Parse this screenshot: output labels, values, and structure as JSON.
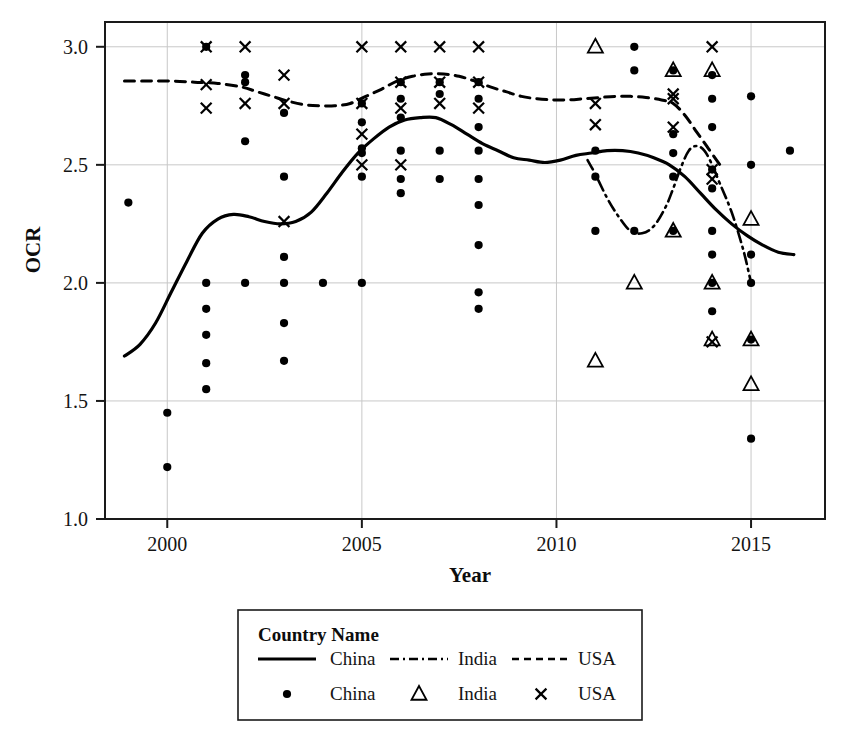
{
  "chart_data": {
    "type": "scatter",
    "title": "",
    "xlabel": "Year",
    "ylabel": "OCR",
    "xlim": [
      1998.4,
      1996.0
    ],
    "x_range": [
      1998.4,
      2016.9
    ],
    "ylim": [
      1.0,
      3.1
    ],
    "grid": true,
    "xticks": [
      2000,
      2005,
      2010,
      2015
    ],
    "xtick_labels": [
      "2000",
      "2005",
      "2010",
      "2015"
    ],
    "yticks": [
      1.0,
      1.5,
      2.0,
      2.5,
      3.0
    ],
    "ytick_labels": [
      "1.0",
      "1.5",
      "2.0",
      "2.5",
      "3.0"
    ],
    "legend": {
      "title": "Country Name",
      "position": "below-plot",
      "line_entries": [
        {
          "label": "China",
          "style": "solid"
        },
        {
          "label": "India",
          "style": "dash-dot"
        },
        {
          "label": "USA",
          "style": "dashed"
        }
      ],
      "marker_entries": [
        {
          "label": "China",
          "marker": "filled-circle"
        },
        {
          "label": "India",
          "marker": "open-triangle"
        },
        {
          "label": "USA",
          "marker": "cross-x"
        }
      ]
    },
    "series": [
      {
        "name": "China",
        "marker": "filled-circle",
        "points": [
          [
            1999,
            2.34
          ],
          [
            2000,
            1.45
          ],
          [
            2000,
            1.22
          ],
          [
            2001,
            3.0
          ],
          [
            2001,
            2.0
          ],
          [
            2001,
            1.89
          ],
          [
            2001,
            1.78
          ],
          [
            2001,
            1.66
          ],
          [
            2001,
            1.55
          ],
          [
            2002,
            2.88
          ],
          [
            2002,
            2.85
          ],
          [
            2002,
            2.6
          ],
          [
            2002,
            2.0
          ],
          [
            2003,
            2.72
          ],
          [
            2003,
            2.45
          ],
          [
            2003,
            2.11
          ],
          [
            2003,
            2.0
          ],
          [
            2003,
            1.83
          ],
          [
            2003,
            1.67
          ],
          [
            2004,
            2.0
          ],
          [
            2005,
            2.76
          ],
          [
            2005,
            2.68
          ],
          [
            2005,
            2.57
          ],
          [
            2005,
            2.55
          ],
          [
            2005,
            2.45
          ],
          [
            2005,
            2.0
          ],
          [
            2006,
            2.85
          ],
          [
            2006,
            2.78
          ],
          [
            2006,
            2.7
          ],
          [
            2006,
            2.56
          ],
          [
            2006,
            2.44
          ],
          [
            2006,
            2.38
          ],
          [
            2007,
            2.85
          ],
          [
            2007,
            2.8
          ],
          [
            2007,
            2.56
          ],
          [
            2007,
            2.44
          ],
          [
            2008,
            2.85
          ],
          [
            2008,
            2.78
          ],
          [
            2008,
            2.66
          ],
          [
            2008,
            2.56
          ],
          [
            2008,
            2.44
          ],
          [
            2008,
            2.33
          ],
          [
            2008,
            2.16
          ],
          [
            2008,
            1.96
          ],
          [
            2008,
            1.89
          ],
          [
            2011,
            2.56
          ],
          [
            2011,
            2.45
          ],
          [
            2011,
            2.22
          ],
          [
            2012,
            3.0
          ],
          [
            2012,
            2.9
          ],
          [
            2012,
            2.22
          ],
          [
            2013,
            2.9
          ],
          [
            2013,
            2.63
          ],
          [
            2013,
            2.55
          ],
          [
            2013,
            2.45
          ],
          [
            2013,
            2.22
          ],
          [
            2014,
            2.88
          ],
          [
            2014,
            2.78
          ],
          [
            2014,
            2.66
          ],
          [
            2014,
            2.48
          ],
          [
            2014,
            2.4
          ],
          [
            2014,
            2.22
          ],
          [
            2014,
            2.12
          ],
          [
            2014,
            2.0
          ],
          [
            2014,
            1.88
          ],
          [
            2015,
            2.79
          ],
          [
            2015,
            2.5
          ],
          [
            2015,
            2.12
          ],
          [
            2015,
            2.0
          ],
          [
            2015,
            1.76
          ],
          [
            2015,
            1.34
          ],
          [
            2016,
            2.56
          ]
        ]
      },
      {
        "name": "India",
        "marker": "open-triangle",
        "points": [
          [
            2011,
            3.0
          ],
          [
            2011,
            1.67
          ],
          [
            2012,
            2.0
          ],
          [
            2013,
            2.9
          ],
          [
            2013,
            2.22
          ],
          [
            2014,
            2.9
          ],
          [
            2014,
            2.0
          ],
          [
            2014,
            1.76
          ],
          [
            2015,
            2.27
          ],
          [
            2015,
            1.76
          ],
          [
            2015,
            1.57
          ]
        ]
      },
      {
        "name": "USA",
        "marker": "cross-x",
        "points": [
          [
            2001,
            3.0
          ],
          [
            2001,
            2.84
          ],
          [
            2001,
            2.74
          ],
          [
            2002,
            3.0
          ],
          [
            2002,
            2.76
          ],
          [
            2003,
            2.88
          ],
          [
            2003,
            2.76
          ],
          [
            2003,
            2.26
          ],
          [
            2005,
            3.0
          ],
          [
            2005,
            2.76
          ],
          [
            2005,
            2.63
          ],
          [
            2005,
            2.5
          ],
          [
            2006,
            3.0
          ],
          [
            2006,
            2.85
          ],
          [
            2006,
            2.74
          ],
          [
            2006,
            2.5
          ],
          [
            2007,
            3.0
          ],
          [
            2007,
            2.85
          ],
          [
            2007,
            2.76
          ],
          [
            2008,
            3.0
          ],
          [
            2008,
            2.85
          ],
          [
            2008,
            2.74
          ],
          [
            2011,
            2.76
          ],
          [
            2011,
            2.67
          ],
          [
            2013,
            2.8
          ],
          [
            2013,
            2.78
          ],
          [
            2013,
            2.66
          ],
          [
            2014,
            3.0
          ],
          [
            2014,
            2.44
          ],
          [
            2014,
            2.48
          ],
          [
            2014,
            1.75
          ]
        ]
      }
    ],
    "trend_lines": [
      {
        "name": "China",
        "style": "solid",
        "points": [
          [
            1998.9,
            1.69
          ],
          [
            1999.3,
            1.74
          ],
          [
            1999.7,
            1.83
          ],
          [
            2000.1,
            1.96
          ],
          [
            2000.5,
            2.09
          ],
          [
            2000.9,
            2.21
          ],
          [
            2001.3,
            2.27
          ],
          [
            2001.7,
            2.29
          ],
          [
            2002.1,
            2.28
          ],
          [
            2002.5,
            2.26
          ],
          [
            2002.9,
            2.25
          ],
          [
            2003.3,
            2.26
          ],
          [
            2003.7,
            2.3
          ],
          [
            2004.1,
            2.38
          ],
          [
            2004.5,
            2.47
          ],
          [
            2004.9,
            2.55
          ],
          [
            2005.3,
            2.61
          ],
          [
            2005.7,
            2.66
          ],
          [
            2006.1,
            2.69
          ],
          [
            2006.5,
            2.7
          ],
          [
            2006.9,
            2.7
          ],
          [
            2007.3,
            2.67
          ],
          [
            2007.7,
            2.63
          ],
          [
            2008.1,
            2.59
          ],
          [
            2008.5,
            2.56
          ],
          [
            2008.9,
            2.53
          ],
          [
            2009.3,
            2.52
          ],
          [
            2009.7,
            2.51
          ],
          [
            2010.1,
            2.52
          ],
          [
            2010.5,
            2.54
          ],
          [
            2010.9,
            2.55
          ],
          [
            2011.3,
            2.56
          ],
          [
            2011.7,
            2.56
          ],
          [
            2012.1,
            2.55
          ],
          [
            2012.5,
            2.53
          ],
          [
            2012.9,
            2.5
          ],
          [
            2013.3,
            2.45
          ],
          [
            2013.7,
            2.38
          ],
          [
            2014.1,
            2.31
          ],
          [
            2014.5,
            2.25
          ],
          [
            2014.9,
            2.2
          ],
          [
            2015.3,
            2.16
          ],
          [
            2015.7,
            2.13
          ],
          [
            2016.1,
            2.12
          ]
        ]
      },
      {
        "name": "India",
        "style": "dash-dot",
        "points": [
          [
            2010.8,
            2.52
          ],
          [
            2011.0,
            2.46
          ],
          [
            2011.3,
            2.36
          ],
          [
            2011.6,
            2.28
          ],
          [
            2011.9,
            2.22
          ],
          [
            2012.2,
            2.21
          ],
          [
            2012.5,
            2.24
          ],
          [
            2012.8,
            2.32
          ],
          [
            2013.0,
            2.4
          ],
          [
            2013.2,
            2.49
          ],
          [
            2013.4,
            2.56
          ],
          [
            2013.6,
            2.58
          ],
          [
            2013.8,
            2.56
          ],
          [
            2014.0,
            2.5
          ],
          [
            2014.2,
            2.42
          ],
          [
            2014.5,
            2.3
          ],
          [
            2014.8,
            2.14
          ],
          [
            2015.0,
            2.0
          ]
        ]
      },
      {
        "name": "USA",
        "style": "dashed",
        "points": [
          [
            1998.9,
            2.855
          ],
          [
            1999.5,
            2.855
          ],
          [
            2000.1,
            2.855
          ],
          [
            2000.7,
            2.85
          ],
          [
            2001.3,
            2.845
          ],
          [
            2001.9,
            2.83
          ],
          [
            2002.3,
            2.81
          ],
          [
            2002.7,
            2.79
          ],
          [
            2003.1,
            2.77
          ],
          [
            2003.5,
            2.755
          ],
          [
            2003.9,
            2.75
          ],
          [
            2004.3,
            2.75
          ],
          [
            2004.7,
            2.76
          ],
          [
            2005.1,
            2.79
          ],
          [
            2005.5,
            2.82
          ],
          [
            2005.9,
            2.855
          ],
          [
            2006.3,
            2.875
          ],
          [
            2006.7,
            2.885
          ],
          [
            2007.1,
            2.885
          ],
          [
            2007.5,
            2.875
          ],
          [
            2007.9,
            2.855
          ],
          [
            2008.3,
            2.83
          ],
          [
            2008.7,
            2.81
          ],
          [
            2009.1,
            2.79
          ],
          [
            2009.5,
            2.78
          ],
          [
            2009.9,
            2.775
          ],
          [
            2010.3,
            2.775
          ],
          [
            2010.7,
            2.78
          ],
          [
            2011.1,
            2.785
          ],
          [
            2011.5,
            2.79
          ],
          [
            2011.9,
            2.79
          ],
          [
            2012.3,
            2.785
          ],
          [
            2012.7,
            2.775
          ],
          [
            2013.0,
            2.76
          ],
          [
            2013.3,
            2.71
          ],
          [
            2013.6,
            2.64
          ],
          [
            2013.9,
            2.57
          ],
          [
            2014.2,
            2.5
          ]
        ]
      }
    ]
  }
}
